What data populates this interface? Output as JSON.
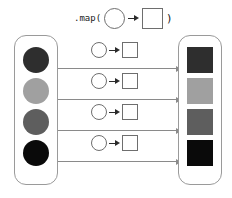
{
  "diagram": {
    "header": {
      "label": ".map(",
      "close_paren": ")",
      "circle_name": "input-shape-circle",
      "arrow_name": "transform-arrow",
      "square_name": "output-shape-square"
    },
    "input_collection": {
      "name": "input-collection",
      "items": [
        {
          "label": "dark-charcoal-circle",
          "color": "#2e2e2e"
        },
        {
          "label": "light-gray-circle",
          "color": "#a0a0a0"
        },
        {
          "label": "medium-gray-circle",
          "color": "#5e5e5e"
        },
        {
          "label": "black-circle",
          "color": "#0a0a0a"
        }
      ]
    },
    "output_collection": {
      "name": "output-collection",
      "items": [
        {
          "label": "dark-charcoal-square",
          "color": "#2e2e2e"
        },
        {
          "label": "light-gray-square",
          "color": "#a0a0a0"
        },
        {
          "label": "medium-gray-square",
          "color": "#5e5e5e"
        },
        {
          "label": "black-square",
          "color": "#0a0a0a"
        }
      ]
    },
    "mappings": [
      {
        "name": "map-row-1"
      },
      {
        "name": "map-row-2"
      },
      {
        "name": "map-row-3"
      },
      {
        "name": "map-row-4"
      }
    ],
    "colors": {
      "stroke": "#6e6e6e",
      "container_stroke": "#9a9a9a",
      "connector": "#8a8a8a",
      "arrow": "#2b2b2b",
      "background": "#ffffff"
    }
  }
}
